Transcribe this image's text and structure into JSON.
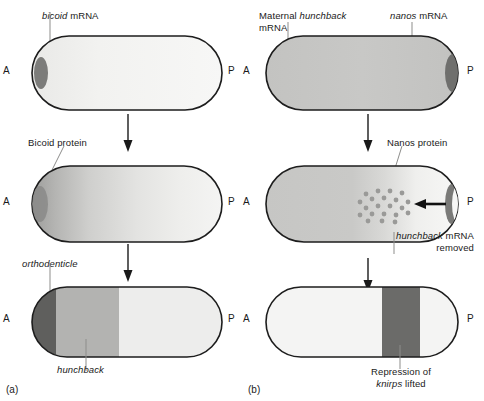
{
  "figure": {
    "panels": [
      {
        "id": "a",
        "caption": "(a)",
        "stages": [
          {
            "name": "bicoid-mrna-stage",
            "label": "bicoid mRNA",
            "label_italic_part": "bicoid",
            "anterior": "A",
            "posterior": "P",
            "fill": "uniform-pale",
            "deposit": "anterior-dark-blob"
          },
          {
            "name": "bicoid-protein-stage",
            "label": "Bicoid protein",
            "label_italic_part": "",
            "anterior": "A",
            "posterior": "P",
            "fill": "anterior-to-posterior-gradient",
            "deposit": "anterior-dark-blob"
          },
          {
            "name": "target-genes-stage",
            "label_top": "orthodenticle",
            "label_bottom": "hunchback",
            "anterior": "A",
            "posterior": "P",
            "fill": "three-bands"
          }
        ]
      },
      {
        "id": "b",
        "caption": "(b)",
        "stages": [
          {
            "name": "maternal-hunchback-nanos-stage",
            "label_left_line1": "Maternal hunchback",
            "label_left_line2": "mRNA",
            "label_left_italic_part": "hunchback",
            "label_right": "nanos mRNA",
            "label_right_italic_part": "nanos",
            "anterior": "A",
            "posterior": "P",
            "fill": "uniform-gray",
            "deposit": "posterior-dark-crescent"
          },
          {
            "name": "nanos-protein-stage",
            "label_top": "Nanos protein",
            "label_bottom_line1": "hunchback mRNA",
            "label_bottom_line2": "removed",
            "label_bottom_italic_part": "hunchback",
            "anterior": "A",
            "posterior": "P",
            "fill": "gray-fading-posterior",
            "deposit": "posterior-dark-crescent",
            "dot_count": 21,
            "arrow": "leftward-thick-arrow"
          },
          {
            "name": "knirps-derepression-stage",
            "label_line1": "Repression of",
            "label_line2": "knirps lifted",
            "label_italic_part": "knirps",
            "anterior": "A",
            "posterior": "P",
            "fill": "pale-with-posterior-dark-band"
          }
        ]
      }
    ],
    "colors": {
      "outline": "#1d1d1d",
      "pale": "#f2f2f1",
      "light_gray": "#ececeb",
      "mid_gray": "#b9b9b7",
      "dark_band": "#6e6e6c",
      "darkest_band": "#5a5a58",
      "deposit": "#7c7c7a",
      "arrow": "#111111",
      "dot": "#9a9a98",
      "leader": "#8d8d8b"
    }
  }
}
